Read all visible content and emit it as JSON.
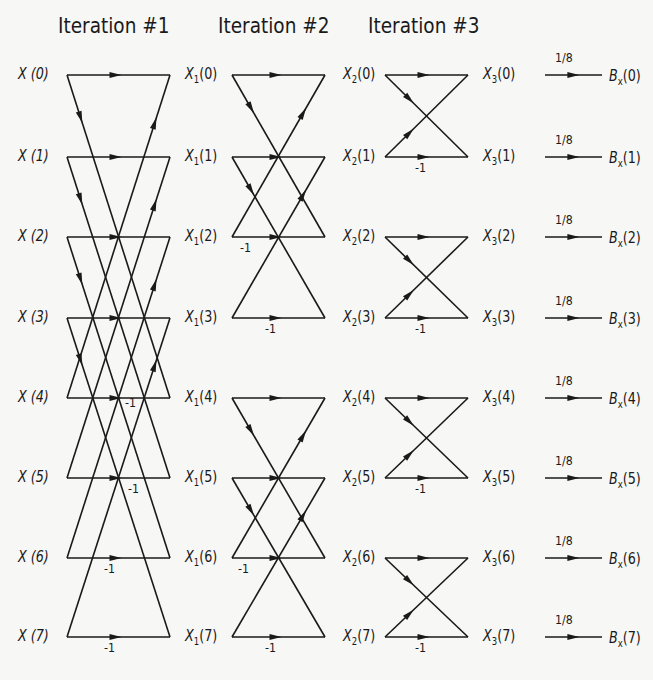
{
  "titles": [
    "Iteration #1",
    "Iteration #2",
    "Iteration #3"
  ],
  "stage0": {
    "prefix": "X",
    "labels": [
      "X (0)",
      "X (1)",
      "X (2)",
      "X (3)",
      "X (4)",
      "X (5)",
      "X (6)",
      "X (7)"
    ]
  },
  "stage1": {
    "symbol": "X",
    "subscript": "1",
    "indices": [
      "(0)",
      "(1)",
      "(2)",
      "(3)",
      "(4)",
      "(5)",
      "(6)",
      "(7)"
    ]
  },
  "stage2": {
    "symbol": "X",
    "subscript": "2",
    "indices": [
      "(0)",
      "(1)",
      "(2)",
      "(3)",
      "(4)",
      "(5)",
      "(6)",
      "(7)"
    ]
  },
  "stage3": {
    "symbol": "X",
    "subscript": "3",
    "indices": [
      "(0)",
      "(1)",
      "(2)",
      "(3)",
      "(4)",
      "(5)",
      "(6)",
      "(7)"
    ]
  },
  "output": {
    "symbol": "B",
    "subscript": "x",
    "indices": [
      "(0)",
      "(1)",
      "(2)",
      "(3)",
      "(4)",
      "(5)",
      "(6)",
      "(7)"
    ]
  },
  "scale_factor": "1/8",
  "twiddle": "-1",
  "iteration1_minus_one_rows": [
    4,
    5,
    6,
    7
  ],
  "iteration2_minus_one_rows": [
    2,
    3,
    6,
    7
  ],
  "iteration3_minus_one_rows": [
    1,
    3,
    5,
    7
  ],
  "layout": {
    "row_y": [
      75,
      157,
      237,
      318,
      398,
      478,
      558,
      637
    ],
    "stage_x": [
      [
        67,
        170
      ],
      [
        232,
        325
      ],
      [
        385,
        468
      ]
    ],
    "line_color": "#1a1a1a"
  }
}
